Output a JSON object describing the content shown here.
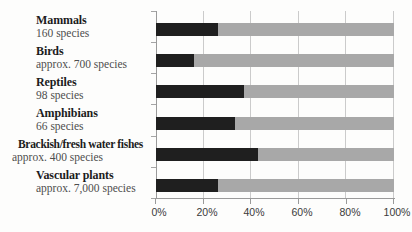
{
  "chart_data": {
    "type": "bar",
    "orientation": "horizontal",
    "stacked": true,
    "title": "",
    "xlabel": "",
    "ylabel": "",
    "x_axis": {
      "range": [
        0,
        100
      ],
      "unit": "%",
      "ticks": [
        "0%",
        "20%",
        "40%",
        "60%",
        "80%",
        "100%"
      ]
    },
    "grid": true,
    "series": [
      {
        "name": "dark-segment",
        "color": "#1f1f1f"
      },
      {
        "name": "remainder-segment",
        "color": "#a8a8a8"
      }
    ],
    "categories": [
      {
        "name": "Mammals",
        "sublabel": "160 species",
        "value": 26
      },
      {
        "name": "Birds",
        "sublabel": "approx. 700 species",
        "value": 16
      },
      {
        "name": "Reptiles",
        "sublabel": "98 species",
        "value": 37
      },
      {
        "name": "Amphibians",
        "sublabel": "66 species",
        "value": 33
      },
      {
        "name": "Brackish/fresh water fishes",
        "sublabel": "approx. 400 species",
        "value": 43
      },
      {
        "name": "Vascular plants",
        "sublabel": "approx. 7,000 species",
        "value": 26
      }
    ]
  }
}
